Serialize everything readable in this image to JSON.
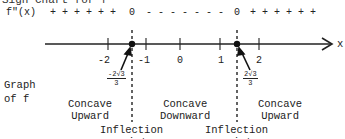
{
  "title": "Sign Chart for f\"",
  "function_label": "f\"(x)",
  "sign_row": {
    "left": "+ + + + + +",
    "zero1": "0",
    "middle": "- - - - - - -",
    "zero2": "0",
    "right": "+ + + + + +"
  },
  "axis": {
    "variable": "x",
    "ticks": [
      "-2",
      "-1",
      "0",
      "1",
      "2"
    ]
  },
  "critical_points": [
    {
      "numerator": "-2√3",
      "denominator": "3"
    },
    {
      "numerator": "2√3",
      "denominator": "3"
    }
  ],
  "graph_label": [
    "Graph",
    "of f"
  ],
  "intervals": [
    {
      "line1": "Concave",
      "line2": "Upward"
    },
    {
      "line1": "Concave",
      "line2": "Downward"
    },
    {
      "line1": "Concave",
      "line2": "Upward"
    }
  ],
  "inflection_labels": [
    {
      "line1": "Inflection",
      "line2": "point"
    },
    {
      "line1": "Inflection",
      "line2": "point"
    }
  ],
  "colors": {
    "ink": "#222222",
    "background": "#ffffff"
  }
}
